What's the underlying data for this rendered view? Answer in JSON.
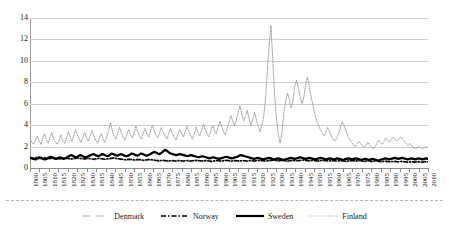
{
  "chart_data": {
    "type": "line",
    "title": "",
    "xlabel": "",
    "ylabel": "",
    "ylim": [
      0,
      14
    ],
    "yticks": [
      0,
      2,
      4,
      6,
      8,
      10,
      12,
      14
    ],
    "xlim": [
      1800,
      2010
    ],
    "grid": true,
    "legend_position": "bottom",
    "xticks": [
      1800,
      1805,
      1810,
      1815,
      1820,
      1825,
      1830,
      1835,
      1840,
      1845,
      1850,
      1855,
      1860,
      1865,
      1870,
      1875,
      1880,
      1885,
      1890,
      1895,
      1900,
      1905,
      1910,
      1915,
      1920,
      1925,
      1930,
      1935,
      1940,
      1945,
      1950,
      1955,
      1960,
      1965,
      1970,
      1975,
      1980,
      1985,
      1990,
      1995,
      2000,
      2005,
      2010
    ],
    "x_start": 1800,
    "x_end": 2010,
    "series": [
      {
        "name": "Denmark",
        "style": "dashed",
        "color": "#b0b0b0",
        "width": 1,
        "values": [
          0.9,
          0.85,
          0.8,
          0.82,
          0.78,
          0.8,
          0.85,
          0.9,
          0.95,
          0.9,
          0.85,
          0.8,
          0.82,
          0.85,
          0.9,
          0.88,
          0.85,
          0.8,
          0.78,
          0.82,
          0.85,
          0.8,
          0.78,
          0.8,
          0.82,
          0.85,
          0.88,
          0.85,
          0.8,
          0.78,
          0.8,
          0.82,
          0.85,
          0.8,
          0.78,
          0.75,
          0.78,
          0.8,
          0.82,
          0.85,
          0.8,
          0.78,
          0.8,
          0.82,
          0.85,
          0.88,
          0.85,
          0.8,
          0.78,
          0.75,
          0.72,
          0.7,
          0.72,
          0.75,
          0.72,
          0.7,
          0.68,
          0.7,
          0.72,
          0.7,
          0.68,
          0.65,
          0.68,
          0.7,
          0.72,
          0.7,
          0.68,
          0.65,
          0.62,
          0.6,
          0.62,
          0.65,
          0.62,
          0.6,
          0.58,
          0.6,
          0.62,
          0.6,
          0.58,
          0.6,
          0.62,
          0.6,
          0.58,
          0.6,
          0.62,
          0.6,
          0.58,
          0.6,
          0.62,
          0.65,
          0.62,
          0.6,
          0.58,
          0.6,
          0.62,
          0.6,
          0.58,
          0.55,
          0.58,
          0.6,
          0.62,
          0.6,
          0.58,
          0.6,
          0.62,
          0.65,
          0.62,
          0.6,
          0.58,
          0.6,
          0.62,
          0.6,
          0.58,
          0.6,
          0.62,
          0.6,
          0.58,
          0.6,
          0.62,
          0.6,
          0.58,
          0.6,
          0.62,
          0.65,
          0.62,
          0.6,
          0.58,
          0.6,
          0.62,
          0.65,
          0.68,
          0.65,
          0.62,
          0.6,
          0.62,
          0.65,
          0.62,
          0.6,
          0.58,
          0.6,
          0.62,
          0.65,
          0.62,
          0.6,
          0.62,
          0.65,
          0.68,
          0.65,
          0.62,
          0.6,
          0.62,
          0.65,
          0.62,
          0.6,
          0.58,
          0.6,
          0.62,
          0.65,
          0.62,
          0.6,
          0.58,
          0.6,
          0.62,
          0.6,
          0.58,
          0.6,
          0.62,
          0.6,
          0.58,
          0.55,
          0.58,
          0.6,
          0.62,
          0.6,
          0.58,
          0.6,
          0.62,
          0.6,
          0.58,
          0.55,
          0.58,
          0.6,
          0.58,
          0.55,
          0.58,
          0.6,
          0.58,
          0.55,
          0.52,
          0.55,
          0.58,
          0.55,
          0.52,
          0.5,
          0.52,
          0.55,
          0.52,
          0.5,
          0.52,
          0.55,
          0.52,
          0.5,
          0.48,
          0.5,
          0.52,
          0.5,
          0.48,
          0.5,
          0.52,
          0.5,
          0.48,
          0.5,
          0.52,
          0.5
        ]
      },
      {
        "name": "Norway",
        "style": "dashdot",
        "color": "#000000",
        "width": 1.6,
        "values": [
          0.95,
          0.92,
          0.9,
          0.95,
          1.0,
          0.95,
          0.9,
          0.92,
          0.95,
          0.9,
          0.88,
          0.9,
          0.92,
          0.95,
          0.9,
          0.88,
          0.85,
          0.88,
          0.9,
          0.92,
          0.9,
          0.88,
          0.85,
          0.88,
          0.9,
          0.92,
          0.95,
          0.9,
          0.88,
          0.85,
          0.88,
          0.9,
          0.88,
          0.85,
          0.82,
          0.85,
          0.88,
          0.9,
          0.88,
          0.85,
          0.82,
          0.85,
          0.88,
          0.9,
          0.92,
          0.95,
          0.9,
          0.88,
          0.85,
          0.82,
          0.8,
          0.78,
          0.8,
          0.82,
          0.8,
          0.78,
          0.75,
          0.78,
          0.8,
          0.78,
          0.75,
          0.72,
          0.75,
          0.78,
          0.8,
          0.78,
          0.75,
          0.72,
          0.7,
          0.68,
          0.7,
          0.72,
          0.7,
          0.68,
          0.65,
          0.68,
          0.7,
          0.68,
          0.65,
          0.68,
          0.7,
          0.68,
          0.65,
          0.68,
          0.7,
          0.68,
          0.65,
          0.68,
          0.7,
          0.72,
          0.7,
          0.68,
          0.65,
          0.68,
          0.7,
          0.68,
          0.65,
          0.62,
          0.65,
          0.68,
          0.7,
          0.68,
          0.65,
          0.68,
          0.7,
          0.72,
          0.7,
          0.68,
          0.65,
          0.68,
          0.7,
          0.68,
          0.65,
          0.68,
          0.7,
          0.68,
          0.65,
          0.68,
          0.7,
          0.68,
          0.65,
          0.68,
          0.7,
          0.72,
          0.7,
          0.68,
          0.65,
          0.68,
          0.7,
          0.72,
          0.75,
          0.72,
          0.7,
          0.68,
          0.7,
          0.72,
          0.7,
          0.68,
          0.65,
          0.68,
          0.7,
          0.72,
          0.7,
          0.68,
          0.7,
          0.72,
          0.75,
          0.72,
          0.7,
          0.68,
          0.7,
          0.72,
          0.7,
          0.68,
          0.65,
          0.68,
          0.7,
          0.72,
          0.7,
          0.68,
          0.65,
          0.68,
          0.7,
          0.68,
          0.65,
          0.68,
          0.7,
          0.68,
          0.65,
          0.62,
          0.65,
          0.68,
          0.7,
          0.68,
          0.65,
          0.68,
          0.7,
          0.68,
          0.65,
          0.62,
          0.65,
          0.68,
          0.65,
          0.62,
          0.65,
          0.68,
          0.65,
          0.62,
          0.6,
          0.62,
          0.65,
          0.62,
          0.6,
          0.58,
          0.6,
          0.62,
          0.6,
          0.58,
          0.6,
          0.62,
          0.6,
          0.58,
          0.55,
          0.58,
          0.6,
          0.58,
          0.55,
          0.58,
          0.6,
          0.58,
          0.55,
          0.58,
          0.6,
          0.58
        ]
      },
      {
        "name": "Sweden",
        "style": "solid",
        "color": "#000000",
        "width": 2.2,
        "values": [
          0.95,
          0.9,
          0.85,
          0.8,
          0.9,
          1.0,
          0.95,
          0.85,
          0.8,
          0.85,
          0.95,
          1.05,
          1.0,
          0.9,
          0.85,
          0.9,
          1.0,
          0.95,
          0.85,
          0.9,
          1.0,
          1.1,
          1.2,
          1.15,
          1.05,
          1.0,
          1.1,
          1.2,
          1.15,
          1.05,
          1.0,
          1.05,
          1.15,
          1.2,
          1.3,
          1.25,
          1.15,
          1.1,
          1.2,
          1.3,
          1.25,
          1.15,
          1.1,
          1.2,
          1.35,
          1.3,
          1.2,
          1.15,
          1.2,
          1.3,
          1.25,
          1.15,
          1.1,
          1.15,
          1.25,
          1.35,
          1.3,
          1.2,
          1.15,
          1.25,
          1.35,
          1.3,
          1.2,
          1.15,
          1.2,
          1.3,
          1.4,
          1.5,
          1.45,
          1.35,
          1.3,
          1.4,
          1.55,
          1.7,
          1.6,
          1.45,
          1.35,
          1.3,
          1.25,
          1.2,
          1.25,
          1.3,
          1.25,
          1.2,
          1.15,
          1.1,
          1.15,
          1.2,
          1.15,
          1.1,
          1.05,
          1.0,
          1.05,
          1.1,
          1.05,
          1.0,
          0.95,
          0.9,
          0.95,
          1.0,
          0.95,
          0.9,
          0.85,
          0.9,
          0.95,
          1.0,
          1.05,
          1.0,
          0.95,
          0.9,
          0.95,
          1.0,
          1.05,
          1.15,
          1.2,
          1.15,
          1.1,
          1.05,
          1.0,
          0.95,
          0.9,
          0.85,
          0.9,
          0.95,
          0.9,
          0.85,
          0.8,
          0.85,
          0.9,
          0.95,
          0.9,
          0.85,
          0.8,
          0.85,
          0.9,
          0.85,
          0.8,
          0.75,
          0.8,
          0.85,
          0.9,
          0.95,
          0.9,
          0.85,
          0.9,
          0.95,
          1.0,
          0.95,
          0.9,
          0.85,
          0.9,
          0.95,
          0.9,
          0.85,
          0.8,
          0.85,
          0.9,
          0.95,
          0.9,
          0.85,
          0.8,
          0.85,
          0.9,
          0.85,
          0.8,
          0.85,
          0.9,
          0.85,
          0.8,
          0.75,
          0.8,
          0.85,
          0.9,
          0.85,
          0.8,
          0.85,
          0.9,
          0.85,
          0.8,
          0.75,
          0.8,
          0.85,
          0.8,
          0.75,
          0.8,
          0.85,
          0.8,
          0.75,
          0.7,
          0.75,
          0.8,
          0.85,
          0.9,
          0.85,
          0.8,
          0.85,
          0.9,
          0.95,
          0.9,
          0.85,
          0.9,
          0.95,
          0.9,
          0.85,
          0.8,
          0.85,
          0.9,
          0.85,
          0.8,
          0.85,
          0.9,
          0.85,
          0.8,
          0.85,
          0.9,
          0.85
        ]
      },
      {
        "name": "Finland",
        "style": "dotted",
        "color": "#999999",
        "width": 1,
        "values": [
          2.7,
          2.4,
          2.2,
          2.6,
          3.0,
          2.5,
          2.2,
          2.8,
          3.2,
          2.6,
          2.3,
          2.9,
          3.3,
          2.7,
          2.4,
          2.2,
          2.6,
          3.1,
          2.5,
          2.3,
          2.8,
          3.4,
          2.9,
          2.5,
          3.0,
          3.6,
          3.1,
          2.7,
          2.4,
          2.9,
          3.3,
          2.8,
          2.5,
          3.0,
          3.5,
          3.0,
          2.6,
          2.3,
          2.8,
          3.2,
          2.7,
          2.4,
          2.9,
          3.4,
          4.2,
          3.6,
          3.0,
          2.7,
          3.2,
          3.8,
          3.3,
          2.9,
          2.6,
          3.1,
          3.6,
          3.1,
          2.8,
          3.3,
          3.9,
          3.4,
          3.0,
          2.7,
          3.2,
          3.7,
          3.2,
          2.9,
          3.4,
          4.0,
          3.5,
          3.1,
          2.8,
          3.3,
          3.8,
          3.3,
          3.0,
          2.7,
          3.2,
          3.7,
          3.2,
          2.9,
          2.6,
          3.1,
          3.6,
          3.2,
          2.9,
          3.4,
          3.9,
          3.4,
          3.0,
          2.7,
          3.2,
          3.8,
          3.3,
          3.0,
          3.5,
          4.1,
          3.6,
          3.2,
          2.9,
          3.4,
          4.0,
          3.5,
          3.2,
          3.8,
          4.4,
          3.9,
          3.4,
          3.1,
          3.7,
          4.3,
          4.9,
          4.4,
          3.9,
          4.5,
          5.2,
          5.8,
          5.0,
          4.4,
          4.8,
          5.4,
          4.6,
          4.0,
          4.5,
          5.2,
          4.5,
          3.9,
          3.4,
          4.0,
          4.8,
          6.5,
          9.0,
          11.5,
          13.3,
          10.0,
          6.8,
          4.6,
          3.2,
          2.3,
          3.4,
          5.0,
          6.2,
          7.0,
          6.4,
          5.6,
          6.2,
          7.6,
          8.2,
          7.4,
          6.6,
          6.0,
          6.6,
          7.8,
          8.5,
          7.6,
          6.6,
          5.8,
          5.0,
          4.4,
          4.0,
          3.6,
          3.3,
          3.0,
          3.3,
          3.8,
          3.4,
          3.0,
          2.7,
          2.5,
          2.8,
          3.2,
          3.8,
          4.3,
          4.0,
          3.5,
          3.0,
          2.7,
          2.4,
          2.2,
          2.0,
          2.2,
          2.5,
          2.3,
          2.1,
          1.9,
          2.1,
          2.4,
          2.2,
          2.0,
          1.8,
          2.0,
          2.3,
          2.6,
          2.4,
          2.2,
          2.5,
          2.8,
          2.6,
          2.4,
          2.7,
          2.9,
          2.7,
          2.5,
          2.7,
          2.9,
          2.7,
          2.5,
          2.3,
          2.1,
          2.3,
          2.1,
          1.9,
          1.8,
          1.9,
          2.0,
          1.9,
          1.8,
          1.9,
          2.0,
          1.9
        ]
      }
    ]
  },
  "legend": {
    "items": [
      {
        "label": "Denmark",
        "swatch": "dashed-line-swatch"
      },
      {
        "label": "Norway",
        "swatch": "dashdot-line-swatch"
      },
      {
        "label": "Sweden",
        "swatch": "solid-line-swatch"
      },
      {
        "label": "Finland",
        "swatch": "dotted-line-swatch"
      }
    ]
  }
}
